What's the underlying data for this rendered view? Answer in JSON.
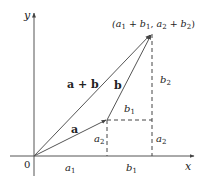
{
  "figure": {
    "axes": {
      "x_label": "x",
      "y_label": "y",
      "origin_label": "0"
    },
    "point_label": "(a1 + b1, a2 + b2)",
    "vectors": [
      {
        "name": "a",
        "label": "a"
      },
      {
        "name": "b",
        "label": "b"
      },
      {
        "name": "sum",
        "label": "a + b"
      }
    ],
    "components": {
      "a1": "a1",
      "a2_left": "a2",
      "a2_right": "a2",
      "b1_top": "b1",
      "b1_bottom": "b1",
      "b2": "b2"
    },
    "colors": {
      "vector": "#555555",
      "axis": "#555555",
      "dashed": "#444444",
      "text": "#222222"
    }
  }
}
